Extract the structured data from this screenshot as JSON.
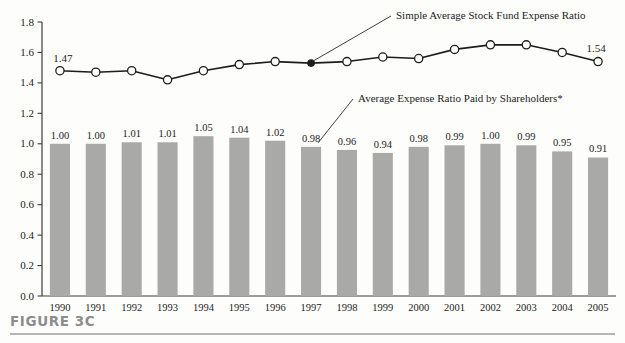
{
  "figure": {
    "caption": "FIGURE 3C",
    "rule_color": "#b5b5b5",
    "caption_color": "#8d8d8d",
    "background": "#fdfdfc"
  },
  "chart_data": {
    "type": "bar",
    "title": "",
    "xlabel": "",
    "ylabel": "",
    "ylim": [
      0.0,
      1.8
    ],
    "yticks": [
      "0.0",
      "0.2",
      "0.4",
      "0.6",
      "0.8",
      "1.0",
      "1.2",
      "1.4",
      "1.6",
      "1.8"
    ],
    "ytick_values": [
      0.0,
      0.2,
      0.4,
      0.6,
      0.8,
      1.0,
      1.2,
      1.4,
      1.6,
      1.8
    ],
    "grid": false,
    "legend_position": "annotated-callouts",
    "categories": [
      "1990",
      "1991",
      "1992",
      "1993",
      "1994",
      "1995",
      "1996",
      "1997",
      "1998",
      "1999",
      "2000",
      "2001",
      "2002",
      "2003",
      "2004",
      "2005"
    ],
    "series": [
      {
        "name": "Average Expense Ratio Paid by Shareholders*",
        "type": "bar",
        "color": "#a9a9a7",
        "values": [
          1.0,
          1.0,
          1.01,
          1.01,
          1.05,
          1.04,
          1.02,
          0.98,
          0.96,
          0.94,
          0.98,
          0.99,
          1.0,
          0.99,
          0.95,
          0.91
        ],
        "labels": [
          "1.00",
          "1.00",
          "1.01",
          "1.01",
          "1.05",
          "1.04",
          "1.02",
          "0.98",
          "0.96",
          "0.94",
          "0.98",
          "0.99",
          "1.00",
          "0.99",
          "0.95",
          "0.91"
        ]
      },
      {
        "name": "Simple Average Stock Fund Expense Ratio",
        "type": "line",
        "color": "#1d1d1d",
        "marker": "open-circle",
        "values": [
          1.48,
          1.47,
          1.48,
          1.42,
          1.48,
          1.52,
          1.54,
          1.53,
          1.54,
          1.57,
          1.56,
          1.62,
          1.65,
          1.65,
          1.6,
          1.54
        ],
        "endpoint_labels": {
          "first": "1.47",
          "last": "1.54"
        },
        "highlight_index": 7
      }
    ],
    "annotations": [
      {
        "text": "Simple Average Stock Fund Expense Ratio",
        "target_index": 7,
        "target_series": "line"
      },
      {
        "text": "Average Expense Ratio Paid by Shareholders*",
        "target_index": 7,
        "target_series": "bar"
      }
    ]
  }
}
